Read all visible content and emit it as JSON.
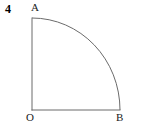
{
  "figure": {
    "problem_number": "4",
    "background_color": "#ffffff",
    "stroke_color": "#6b6b6b",
    "label_color": "#1a1a1a",
    "stroke_width": 1,
    "points": {
      "A": {
        "label": "A",
        "x": 32,
        "y": 18
      },
      "O": {
        "label": "O",
        "x": 32,
        "y": 110
      },
      "B": {
        "label": "B",
        "x": 120,
        "y": 110
      }
    },
    "geometry": {
      "centre": "O",
      "radius": 90,
      "sector_angle_degrees": 90,
      "segments": [
        {
          "name": "radius-OA",
          "from": "O",
          "to": "A",
          "type": "line"
        },
        {
          "name": "radius-OB",
          "from": "O",
          "to": "B",
          "type": "line"
        },
        {
          "name": "arc-AB",
          "from": "A",
          "to": "B",
          "type": "arc"
        }
      ]
    }
  }
}
